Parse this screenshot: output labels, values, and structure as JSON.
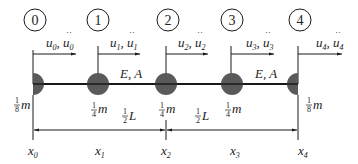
{
  "diagram": {
    "type": "lumped-mass bar model",
    "colors": {
      "line": "#1a1a1a",
      "mass": "#5a5a5a",
      "text": "#222222"
    },
    "nodes": [
      {
        "id": "0",
        "x": 33,
        "disp": "u",
        "sub": "0",
        "mass_num": "1",
        "mass_den": "8",
        "mass_sym": "m",
        "half": "right",
        "coord": "x",
        "coord_sub": "0"
      },
      {
        "id": "1",
        "x": 98,
        "disp": "u",
        "sub": "1",
        "mass_num": "1",
        "mass_den": "4",
        "mass_sym": "m",
        "half": "full",
        "coord": "x",
        "coord_sub": "1"
      },
      {
        "id": "2",
        "x": 166,
        "disp": "u",
        "sub": "2",
        "mass_num": "1",
        "mass_den": "4",
        "mass_sym": "m",
        "half": "full",
        "coord": "x",
        "coord_sub": "2"
      },
      {
        "id": "3",
        "x": 232,
        "disp": "u",
        "sub": "3",
        "mass_num": "1",
        "mass_den": "4",
        "mass_sym": "m",
        "half": "full",
        "coord": "x",
        "coord_sub": "3"
      },
      {
        "id": "4",
        "x": 298,
        "disp": "u",
        "sub": "4",
        "mass_num": "1",
        "mass_den": "8",
        "mass_sym": "m",
        "half": "left",
        "coord": "x",
        "coord_sub": "4"
      }
    ],
    "elements": [
      {
        "label": "E, A",
        "x": 150
      },
      {
        "label": "E, A",
        "x": 250
      }
    ],
    "dimensions": [
      {
        "num": "1",
        "den": "2",
        "sym": "L",
        "from": "x0",
        "to": "x2"
      },
      {
        "num": "1",
        "den": "2",
        "sym": "L",
        "from": "x2",
        "to": "x4"
      }
    ]
  }
}
